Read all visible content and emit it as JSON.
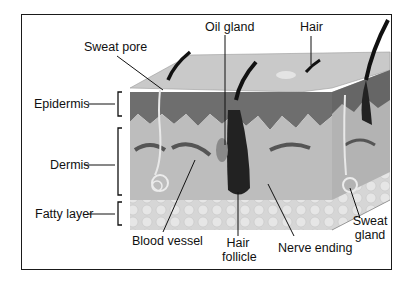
{
  "labels": {
    "sweat_pore": "Sweat pore",
    "oil_gland": "Oil gland",
    "hair": "Hair",
    "epidermis": "Epidermis",
    "dermis": "Dermis",
    "fatty_layer": "Fatty layer",
    "blood_vessel": "Blood vessel",
    "hair_follicle_line1": "Hair",
    "hair_follicle_line2": "follicle",
    "nerve_ending": "Nerve ending",
    "sweat_gland_line1": "Sweat",
    "sweat_gland_line2": "gland"
  },
  "colors": {
    "surface": "#c9c9c9",
    "epidermis": "#6e6e6e",
    "dermis": "#bdbdbd",
    "fat": "#d8d8d8",
    "hair": "#111111",
    "frame": "#1a1a1a"
  }
}
